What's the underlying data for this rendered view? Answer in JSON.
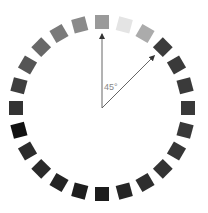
{
  "diagram": {
    "center": [
      102,
      108
    ],
    "radius": 86,
    "square_size": 14,
    "angle_label": "45°",
    "arrow_color": "#555555",
    "squares": [
      {
        "angle": 0,
        "color": "#9a9a9a"
      },
      {
        "angle": 15,
        "color": "#e4e4e4"
      },
      {
        "angle": 30,
        "color": "#ababab"
      },
      {
        "angle": 45,
        "color": "#3c3c3c"
      },
      {
        "angle": 60,
        "color": "#3a3a3a"
      },
      {
        "angle": 75,
        "color": "#3a3a3a"
      },
      {
        "angle": 90,
        "color": "#393939"
      },
      {
        "angle": 105,
        "color": "#383838"
      },
      {
        "angle": 120,
        "color": "#363636"
      },
      {
        "angle": 135,
        "color": "#333333"
      },
      {
        "angle": 150,
        "color": "#2e2e2e"
      },
      {
        "angle": 165,
        "color": "#262626"
      },
      {
        "angle": 180,
        "color": "#1c1c1c"
      },
      {
        "angle": 195,
        "color": "#1e1e1e"
      },
      {
        "angle": 210,
        "color": "#242424"
      },
      {
        "angle": 225,
        "color": "#2a2a2a"
      },
      {
        "angle": 240,
        "color": "#2c2c2c"
      },
      {
        "angle": 255,
        "color": "#111111"
      },
      {
        "angle": 270,
        "color": "#333333"
      },
      {
        "angle": 285,
        "color": "#3e3e3e"
      },
      {
        "angle": 300,
        "color": "#555555"
      },
      {
        "angle": 315,
        "color": "#686868"
      },
      {
        "angle": 330,
        "color": "#7a7a7a"
      },
      {
        "angle": 345,
        "color": "#8a8a8a"
      }
    ],
    "arrows": [
      {
        "name": "arrow-0-degrees",
        "angle": 0,
        "length": 74
      },
      {
        "name": "arrow-45-degrees",
        "angle": 45,
        "length": 74
      }
    ]
  }
}
